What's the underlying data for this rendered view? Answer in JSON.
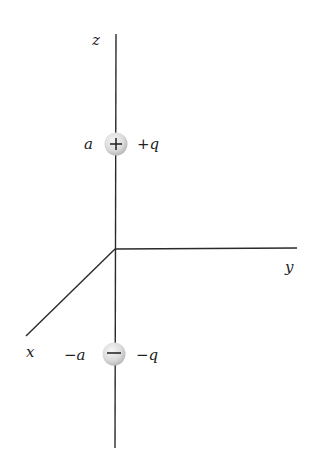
{
  "diagram": {
    "axes": {
      "z": {
        "label": "z"
      },
      "y": {
        "label": "y"
      },
      "x": {
        "label": "x"
      }
    },
    "charges": [
      {
        "position_label": "a",
        "charge_label": "+q",
        "sign": "+",
        "location": "z = a"
      },
      {
        "position_label": "−a",
        "charge_label": "−q",
        "sign": "−",
        "location": "z = −a"
      }
    ],
    "colors": {
      "axis": "#2a2a2a",
      "sphere_light": "#f4f4f4",
      "sphere_dark": "#b8b8b8",
      "text": "#222222"
    }
  }
}
